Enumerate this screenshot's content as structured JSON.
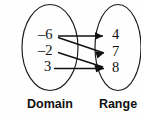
{
  "diagram": {
    "type": "mapping-diagram",
    "title": "",
    "background_color": "#fefefe",
    "line_color": "#111111",
    "oval_stroke_color": "#1a1a1a",
    "domain": {
      "label": "Domain",
      "elements": [
        {
          "value": "–6",
          "id": "neg6"
        },
        {
          "value": "–2",
          "id": "neg2"
        },
        {
          "value": "3",
          "id": "pos3"
        }
      ]
    },
    "range": {
      "label": "Range",
      "elements": [
        {
          "value": "4",
          "id": "r4"
        },
        {
          "value": "7",
          "id": "r7"
        },
        {
          "value": "8",
          "id": "r8"
        }
      ]
    },
    "mappings": [
      {
        "from": "–6",
        "to": "4"
      },
      {
        "from": "–6",
        "to": "7"
      },
      {
        "from": "–2",
        "to": "8"
      },
      {
        "from": "3",
        "to": "8"
      }
    ]
  }
}
